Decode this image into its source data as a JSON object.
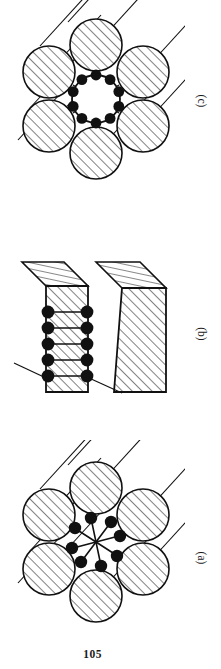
{
  "document": {
    "page_number": "105",
    "background_color": "#ffffff",
    "ink_color": "#111111"
  },
  "figure": {
    "panels": [
      {
        "id": "c",
        "label": "(c)",
        "caption_position": "right-rotated",
        "description": "Cross-section of a wire rope strand: six hatched outer wires surrounding a hollow circular core ring studded with ten filled particles; each outer wire has a tangent lay line extending to the upper left.",
        "outer_wire_count": 6,
        "core_type": "hollow-ring",
        "core_particle_count": 10,
        "lay_line_count": 6,
        "hatch_angle_deg": 45
      },
      {
        "id": "b",
        "label": "(b)",
        "caption_position": "right-rotated",
        "description": "Side elevation of two hatched wedge-topped blocks; the left block carries five stacked rows of paired filled particles bridging its faces, with two leader lines drawn to the lower left and lower right.",
        "block_count": 2,
        "particle_row_count": 5,
        "particles_per_row": 2,
        "leader_line_count": 2,
        "hatch_angle_deg": 45
      },
      {
        "id": "a",
        "label": "(a)",
        "caption_position": "right-rotated",
        "description": "Cross-section of a wire rope strand: six hatched outer wires surrounding a central pinwheel of eight stemmed filled particles radiating from a common centre; each outer wire has a tangent lay line extending to the upper left.",
        "outer_wire_count": 6,
        "core_type": "pinwheel",
        "core_particle_count": 8,
        "lay_line_count": 6,
        "hatch_angle_deg": 45
      }
    ]
  }
}
